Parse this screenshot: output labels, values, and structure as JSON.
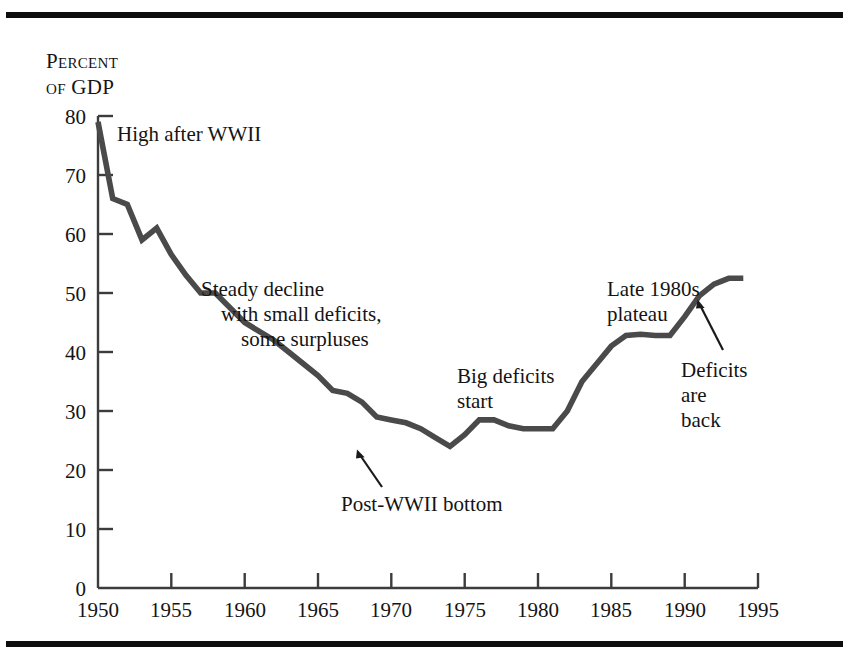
{
  "figure": {
    "axis_title_line1": "Percent",
    "axis_title_line2_prefix": "of",
    "axis_title_line2_rest": "GDP",
    "line_color": "#4a4a4a",
    "axis_color": "#3c3c3c",
    "rule_color": "#0d0d0d",
    "text_color": "#141414"
  },
  "annotations": {
    "high_after_wwii": "High after WWII",
    "steady_decline_1": "Steady decline",
    "steady_decline_2": "with small deficits,",
    "steady_decline_3": "some surpluses",
    "big_deficits_1": "Big deficits",
    "big_deficits_2": "start",
    "plateau_1": "Late 1980s",
    "plateau_2": "plateau",
    "deficits_back_1": "Deficits",
    "deficits_back_2": "are",
    "deficits_back_3": "back",
    "post_wwii_bottom": "Post-WWII bottom"
  },
  "chart_data": {
    "type": "line",
    "title": "",
    "subtitle": "",
    "xlabel": "",
    "ylabel": "Percent of GDP",
    "xlim": [
      1950,
      1995
    ],
    "ylim": [
      0,
      80
    ],
    "xticks": [
      1950,
      1955,
      1960,
      1965,
      1970,
      1975,
      1980,
      1985,
      1990,
      1995
    ],
    "xtick_labels": [
      "1950",
      "1955",
      "1960",
      "1965",
      "1970",
      "1975",
      "1980",
      "1985",
      "1990",
      "1995"
    ],
    "yticks": [
      0,
      10,
      20,
      30,
      40,
      50,
      60,
      70,
      80
    ],
    "ytick_labels": [
      "0",
      "10",
      "20",
      "30",
      "40",
      "50",
      "60",
      "70",
      "80"
    ],
    "grid": false,
    "legend": false,
    "legend_position": "none",
    "series": [
      {
        "name": "Federal debt held by the public as a percent of GDP",
        "x": [
          1950,
          1951,
          1952,
          1953,
          1954,
          1955,
          1956,
          1957,
          1958,
          1959,
          1960,
          1961,
          1962,
          1963,
          1964,
          1965,
          1966,
          1967,
          1968,
          1969,
          1970,
          1971,
          1972,
          1973,
          1974,
          1975,
          1976,
          1977,
          1978,
          1979,
          1980,
          1981,
          1982,
          1983,
          1984,
          1985,
          1986,
          1987,
          1988,
          1989,
          1990,
          1991,
          1992,
          1993,
          1994
        ],
        "values": [
          79.0,
          66.0,
          65.0,
          59.0,
          61.0,
          56.5,
          53.0,
          50.0,
          50.0,
          47.5,
          45.0,
          43.5,
          42.0,
          40.0,
          38.0,
          36.0,
          33.5,
          33.0,
          31.5,
          29.0,
          28.5,
          28.0,
          27.0,
          25.5,
          24.0,
          26.0,
          28.5,
          28.5,
          27.5,
          27.0,
          27.0,
          27.0,
          30.0,
          35.0,
          38.0,
          41.0,
          42.8,
          43.0,
          42.8,
          42.8,
          46.0,
          49.5,
          51.5,
          52.5,
          52.5
        ]
      }
    ],
    "annotation_arrows": [
      {
        "label": "Post-WWII bottom",
        "from": [
          1974.8,
          16.5
        ],
        "to": [
          1973.9,
          23.0
        ]
      },
      {
        "label": "Deficits are back",
        "from": [
          1991.4,
          36.0
        ],
        "to": [
          1989.8,
          44.5
        ]
      }
    ]
  }
}
